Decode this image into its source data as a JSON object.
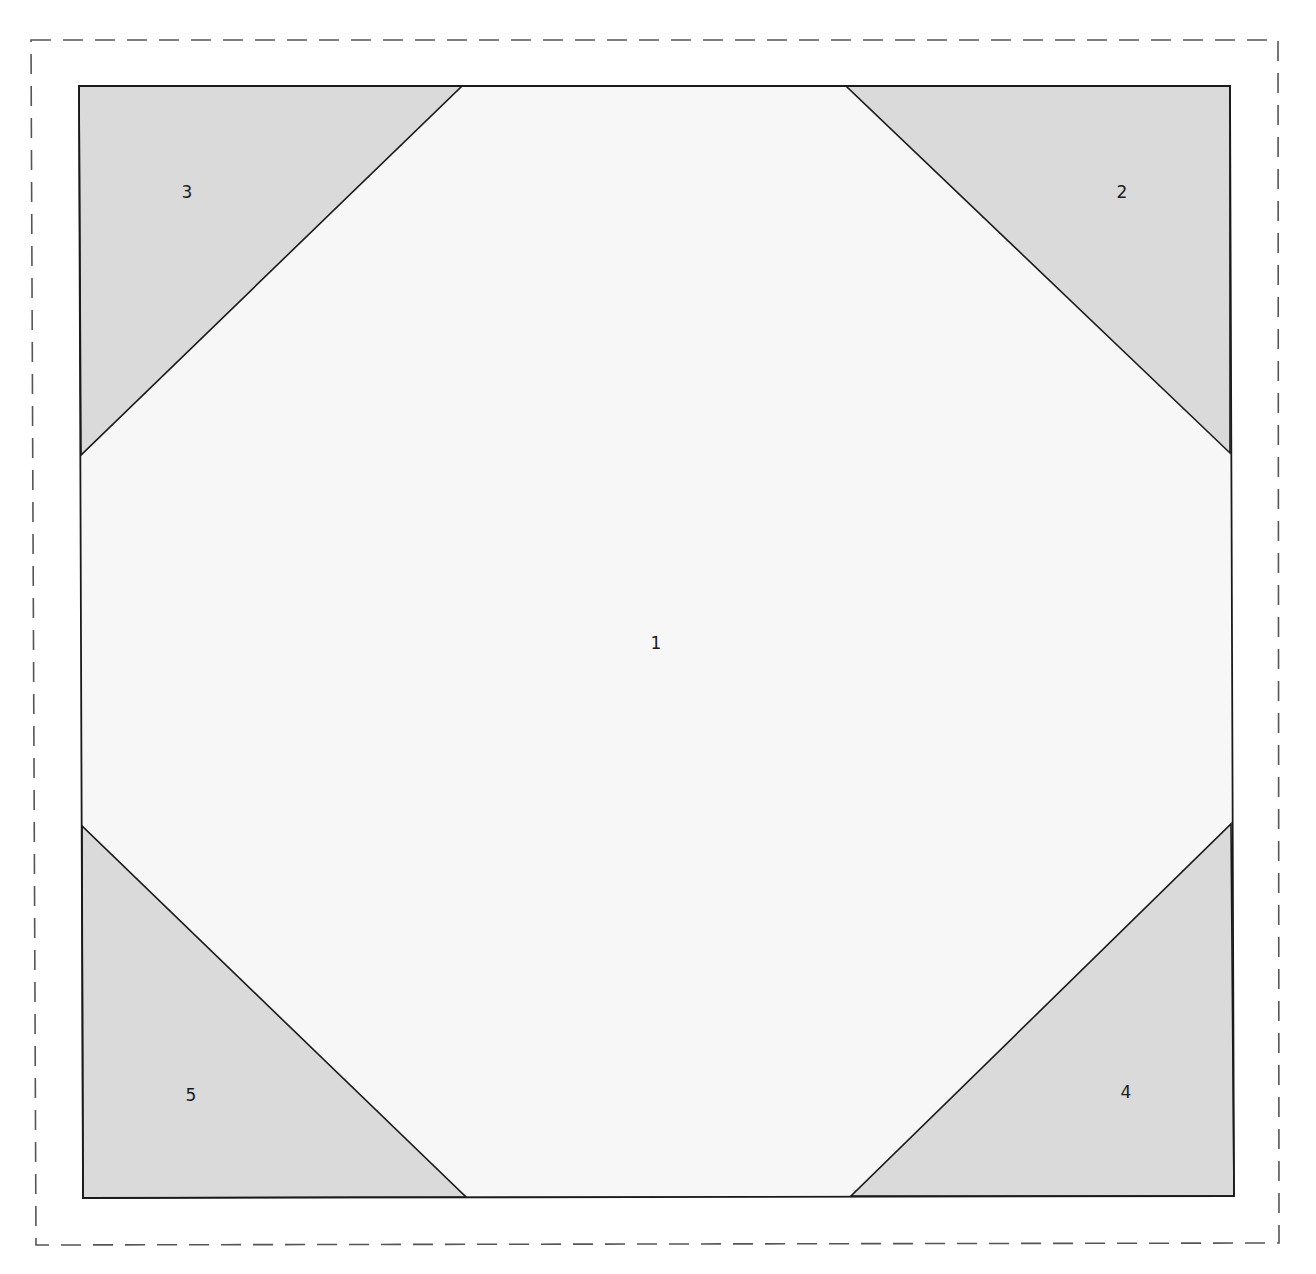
{
  "diagram": {
    "type": "quilt-block-template",
    "colors": {
      "background": "#ffffff",
      "center_fill": "#f7f7f7",
      "corner_fill": "#dadada",
      "outline": "#1a1a1a",
      "seam_allowance_dash": "#555555"
    },
    "pieces": [
      {
        "id": "1",
        "label": "1",
        "shape": "octagon",
        "position": "center"
      },
      {
        "id": "2",
        "label": "2",
        "shape": "triangle",
        "position": "top-right"
      },
      {
        "id": "3",
        "label": "3",
        "shape": "triangle",
        "position": "top-left"
      },
      {
        "id": "4",
        "label": "4",
        "shape": "triangle",
        "position": "bottom-right"
      },
      {
        "id": "5",
        "label": "5",
        "shape": "triangle",
        "position": "bottom-left"
      }
    ]
  }
}
